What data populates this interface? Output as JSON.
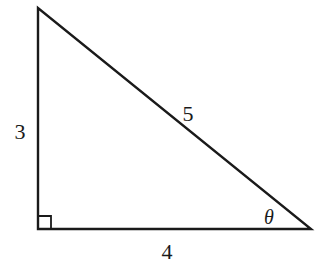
{
  "diagram": {
    "type": "right-triangle",
    "vertices": {
      "top": [
        38,
        8
      ],
      "right_angle": [
        38,
        229
      ],
      "right": [
        311,
        229
      ]
    },
    "right_angle_marker": true,
    "sides": {
      "vertical": {
        "label": "3",
        "pos": [
          20,
          139
        ]
      },
      "hypotenuse": {
        "label": "5",
        "pos": [
          188,
          121
        ]
      },
      "horizontal": {
        "label": "4",
        "pos": [
          167,
          259
        ]
      }
    },
    "angle": {
      "label": "θ",
      "pos": [
        269,
        224
      ]
    },
    "stroke_color": "#1a1a1a",
    "background": "#ffffff"
  }
}
